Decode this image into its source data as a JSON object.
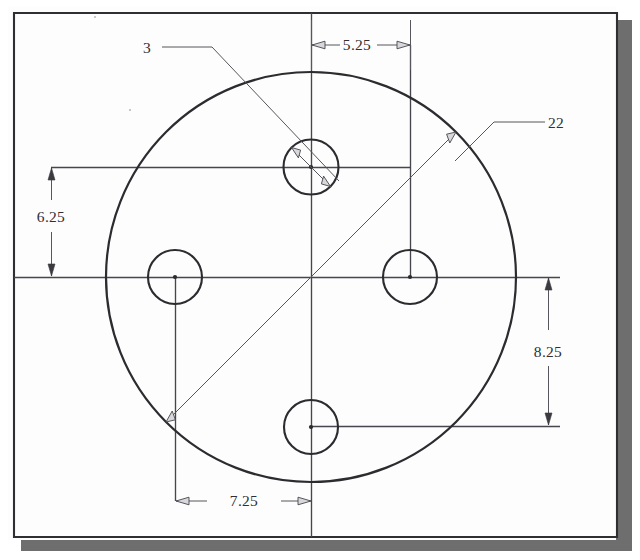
{
  "document": {
    "kind": "engineering-drawing",
    "view": "front-view-circular-plate",
    "background_color": "#ffffff",
    "paper_color": "#fdfdfd",
    "line_color": "#2b2b30",
    "dimension_color": "#56565c",
    "shadow_color": "#6e6e6e"
  },
  "drawing": {
    "border": {
      "x": 14,
      "y": 13,
      "width": 603,
      "height": 524
    },
    "main_circle": {
      "label": "plate-outline",
      "cx": 311,
      "cy": 277,
      "r": 205
    },
    "holes": [
      {
        "name": "top-hole",
        "cx": 311,
        "cy": 167,
        "r": 27.5
      },
      {
        "name": "left-hole",
        "cx": 175,
        "cy": 277,
        "r": 27.0
      },
      {
        "name": "right-hole",
        "cx": 410,
        "cy": 277,
        "r": 27.0
      },
      {
        "name": "bottom-hole",
        "cx": 311,
        "cy": 427,
        "r": 27.0
      }
    ],
    "center_lines": [
      {
        "name": "horizontal-centerline",
        "x1": 14,
        "y1": 277,
        "x2": 560,
        "y2": 277
      },
      {
        "name": "vertical-centerline",
        "x1": 311,
        "y1": 13,
        "x2": 311,
        "y2": 537
      }
    ]
  },
  "dimensions": [
    {
      "id": "hole-diameter",
      "value": "3",
      "type": "diameter",
      "target": "top-hole",
      "label_x": 150,
      "label_y": 52,
      "leader": "horizontal then diagonal, double arrow across hole"
    },
    {
      "id": "plate-diameter",
      "value": "22",
      "type": "diameter",
      "target": "plate-outline",
      "label_x": 548,
      "label_y": 128,
      "leader": "horizontal then diagonal, arrows at both ends of outline"
    },
    {
      "id": "top-hole-horizontal-offset",
      "value": "5.25",
      "type": "linear-horizontal",
      "from": "top-hole-centerline",
      "to": "right-extension-line",
      "label_x": 357,
      "label_y": 49,
      "y": 45,
      "x1": 311,
      "x2": 411
    },
    {
      "id": "top-hole-vertical-offset",
      "value": "6.25",
      "type": "linear-vertical",
      "from": "top-hole-centerline",
      "to": "horizontal-centerline",
      "label_x": 48,
      "label_y": 222,
      "x": 51,
      "y1": 168,
      "y2": 276
    },
    {
      "id": "bottom-hole-vertical-offset",
      "value": "8.25",
      "type": "linear-vertical",
      "from": "horizontal-centerline",
      "to": "bottom-hole-centerline",
      "label_x": 550,
      "label_y": 357,
      "x": 548,
      "y1": 278,
      "y2": 425
    },
    {
      "id": "left-hole-horizontal-offset",
      "value": "7.25",
      "type": "linear-horizontal",
      "from": "left-extension-line",
      "to": "vertical-centerline",
      "label_x": 249,
      "label_y": 505,
      "y": 501,
      "x1": 176,
      "x2": 311
    }
  ]
}
